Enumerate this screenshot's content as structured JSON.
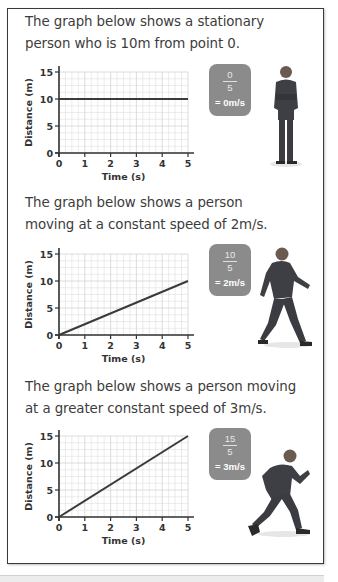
{
  "sections": [
    {
      "caption_lines": [
        "The graph below shows a stationary",
        "person who is 10m from point 0."
      ],
      "badge": {
        "numerator": "0",
        "denominator": "5",
        "result": "= 0m/s"
      },
      "figure": "standing-person"
    },
    {
      "caption_lines": [
        "The graph below shows a person",
        "moving at a constant speed of 2m/s."
      ],
      "badge": {
        "numerator": "10",
        "denominator": "5",
        "result": "= 2m/s"
      },
      "figure": "walking-person"
    },
    {
      "caption_lines": [
        "The graph below shows a person moving",
        "at a greater constant speed of 3m/s."
      ],
      "badge": {
        "numerator": "15",
        "denominator": "5",
        "result": "= 3m/s"
      },
      "figure": "running-person"
    }
  ],
  "colors": {
    "badge": "#8b8b8b",
    "line": "#3a3a3a",
    "grid": "#d8d8d8"
  },
  "chart_data": [
    {
      "type": "line",
      "title": "",
      "xlabel": "Time (s)",
      "ylabel": "Distance (m)",
      "x": [
        0,
        5
      ],
      "series": [
        {
          "name": "stationary",
          "values": [
            10,
            10
          ]
        }
      ],
      "xlim": [
        0,
        5
      ],
      "ylim": [
        0,
        15
      ],
      "xticks": [
        "0",
        "1",
        "2",
        "3",
        "4",
        "5"
      ],
      "yticks": [
        "0",
        "5",
        "10",
        "15"
      ],
      "grid": true
    },
    {
      "type": "line",
      "title": "",
      "xlabel": "Time (s)",
      "ylabel": "Distance (m)",
      "x": [
        0,
        5
      ],
      "series": [
        {
          "name": "2 m/s",
          "values": [
            0,
            10
          ]
        }
      ],
      "xlim": [
        0,
        5
      ],
      "ylim": [
        0,
        15
      ],
      "xticks": [
        "0",
        "1",
        "2",
        "3",
        "4",
        "5"
      ],
      "yticks": [
        "0",
        "5",
        "10",
        "15"
      ],
      "grid": true
    },
    {
      "type": "line",
      "title": "",
      "xlabel": "Time (s)",
      "ylabel": "Distance (m)",
      "x": [
        0,
        5
      ],
      "series": [
        {
          "name": "3 m/s",
          "values": [
            0,
            15
          ]
        }
      ],
      "xlim": [
        0,
        5
      ],
      "ylim": [
        0,
        15
      ],
      "xticks": [
        "0",
        "1",
        "2",
        "3",
        "4",
        "5"
      ],
      "yticks": [
        "0",
        "5",
        "10",
        "15"
      ],
      "grid": true
    }
  ]
}
